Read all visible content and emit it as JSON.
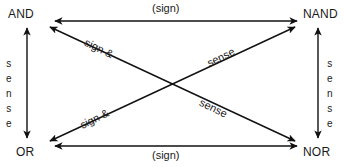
{
  "diagram": {
    "background_color": "#ffffff",
    "line_color": "#111111",
    "text_color": "#1a1a1a",
    "nodes": [
      {
        "id": "and",
        "label": "AND",
        "position": "top-left"
      },
      {
        "id": "nand",
        "label": "NAND",
        "position": "top-right"
      },
      {
        "id": "or",
        "label": "OR",
        "position": "bottom-left"
      },
      {
        "id": "nor",
        "label": "NOR",
        "position": "bottom-right"
      }
    ],
    "edges": [
      {
        "id": "and-nand",
        "from": "AND",
        "to": "NAND",
        "label": "(sign)",
        "orientation": "horizontal",
        "arrows": "double"
      },
      {
        "id": "or-nor",
        "from": "OR",
        "to": "NOR",
        "label": "(sign)",
        "orientation": "horizontal",
        "arrows": "double"
      },
      {
        "id": "and-or",
        "from": "AND",
        "to": "OR",
        "label": "sense",
        "orientation": "vertical",
        "arrows": "double"
      },
      {
        "id": "nand-nor",
        "from": "NAND",
        "to": "NOR",
        "label": "sense",
        "orientation": "vertical",
        "arrows": "double"
      },
      {
        "id": "and-nor",
        "from": "AND",
        "to": "NOR",
        "label": "sign &",
        "orientation": "diagonal",
        "arrows": "double"
      },
      {
        "id": "or-nand",
        "from": "OR",
        "to": "NAND",
        "label": "sign &",
        "orientation": "diagonal",
        "arrows": "double"
      }
    ],
    "edge_labels": {
      "top": "(sign)",
      "bottom": "(sign)",
      "left_vertical": [
        "s",
        "e",
        "n",
        "s",
        "e"
      ],
      "right_vertical": [
        "s",
        "e",
        "n",
        "s",
        "e"
      ],
      "top_left_diagonal": "sign &",
      "top_right_diagonal": "sense",
      "bottom_left_diagonal": "sign &",
      "bottom_right_diagonal": "sense"
    }
  }
}
